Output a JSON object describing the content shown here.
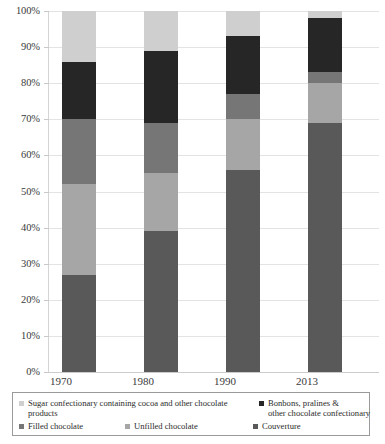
{
  "chart_data": {
    "type": "bar",
    "subtype": "stacked-100-percent",
    "title": "",
    "xlabel": "",
    "ylabel": "",
    "ylim": [
      0,
      100
    ],
    "yticks": [
      "0%",
      "10%",
      "20%",
      "30%",
      "40%",
      "50%",
      "60%",
      "70%",
      "80%",
      "90%",
      "100%"
    ],
    "ytick_values": [
      0,
      10,
      20,
      30,
      40,
      50,
      60,
      70,
      80,
      90,
      100
    ],
    "grid": true,
    "legend_position": "bottom",
    "categories": [
      "1970",
      "1980",
      "1990",
      "2013"
    ],
    "series": [
      {
        "name": "Couverture",
        "color": "#595959",
        "values": [
          27,
          39,
          56,
          69
        ]
      },
      {
        "name": "Unfilled chocolate",
        "color": "#a6a6a6",
        "values": [
          25,
          16,
          14,
          11
        ]
      },
      {
        "name": "Filled chocolate",
        "color": "#767676",
        "values": [
          18,
          14,
          7,
          3
        ]
      },
      {
        "name": "Bonbons, pralines & other chocolate confectionary",
        "color": "#262626",
        "values": [
          16,
          20,
          16,
          15
        ]
      },
      {
        "name": "Sugar confectionary containing cocoa and other chocolate products",
        "color": "#cfcfcf",
        "values": [
          14,
          11,
          7,
          2
        ]
      }
    ]
  },
  "axis": {
    "y_labels": [
      "100%",
      "90%",
      "80%",
      "70%",
      "60%",
      "50%",
      "40%",
      "30%",
      "20%",
      "10%",
      "0%"
    ],
    "x_labels": [
      "1970",
      "1980",
      "1990",
      "2013"
    ]
  },
  "legend": {
    "items": [
      {
        "key": "sugar",
        "label": "Sugar confectionary containing cocoa and other chocolate products",
        "color": "#cfcfcf"
      },
      {
        "key": "bonbons",
        "label": "Bonbons, pralines &\nother chocolate confectionary",
        "color": "#262626"
      },
      {
        "key": "filled",
        "label": "Filled chocolate",
        "color": "#767676"
      },
      {
        "key": "unfilled",
        "label": "Unfilled chocolate",
        "color": "#a6a6a6"
      },
      {
        "key": "couverture",
        "label": "Couverture",
        "color": "#595959"
      }
    ]
  }
}
